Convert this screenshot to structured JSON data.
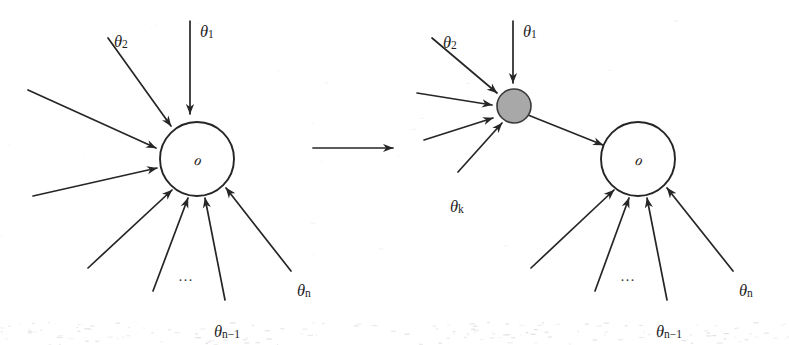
{
  "figure": {
    "background_color": "#ffffff",
    "ink_color": "#262626",
    "filled_node_color": "#a8a8a8",
    "width": 789,
    "height": 345
  },
  "transition": {
    "arrow_name": "transformation-arrow",
    "direction": "right",
    "x1": 313,
    "x2": 393,
    "y": 148
  },
  "panels": [
    {
      "id": "before",
      "name": "left-panel",
      "node": {
        "label": "ℴ",
        "kind": "open-circle",
        "cx": 197,
        "cy": 159,
        "r": 37
      },
      "inputs": [
        {
          "label_base": "θ",
          "label_sub": "1",
          "name": "theta-1-arrow",
          "x1": 190,
          "y1": 21,
          "x2": 190,
          "y2": 114,
          "label_x": 200,
          "label_y": 25
        },
        {
          "label_base": "θ",
          "label_sub": "2",
          "name": "theta-2-arrow",
          "x1": 108,
          "y1": 38,
          "x2": 171,
          "y2": 126,
          "label_x": 114,
          "label_y": 35
        },
        {
          "label_base": "",
          "label_sub": "",
          "name": "input-arrow-3",
          "x1": 28,
          "y1": 90,
          "x2": 156,
          "y2": 148,
          "label_x": 0,
          "label_y": 0
        },
        {
          "label_base": "",
          "label_sub": "",
          "name": "input-arrow-4",
          "x1": 33,
          "y1": 196,
          "x2": 157,
          "y2": 168,
          "label_x": 0,
          "label_y": 0
        },
        {
          "label_base": "",
          "label_sub": "",
          "name": "input-arrow-5",
          "x1": 88,
          "y1": 268,
          "x2": 172,
          "y2": 190,
          "label_x": 0,
          "label_y": 0
        },
        {
          "label_base": "",
          "label_sub": "",
          "name": "input-arrow-6",
          "x1": 153,
          "y1": 291,
          "x2": 188,
          "y2": 198,
          "label_x": 0,
          "label_y": 0
        },
        {
          "label_base": "θ",
          "label_sub": "n−1",
          "name": "theta-n-1-arrow",
          "x1": 225,
          "y1": 300,
          "x2": 205,
          "y2": 198,
          "label_x": 214,
          "label_y": 325
        },
        {
          "label_base": "θ",
          "label_sub": "n",
          "name": "theta-n-arrow",
          "x1": 291,
          "y1": 271,
          "x2": 226,
          "y2": 188,
          "label_x": 297,
          "label_y": 284
        }
      ],
      "ellipsis": {
        "text": "…",
        "x": 186,
        "y": 281
      }
    },
    {
      "id": "after",
      "name": "right-panel",
      "filled_node": {
        "name": "aggregate-node",
        "kind": "filled-circle",
        "cx": 514,
        "cy": 106,
        "r": 17
      },
      "node": {
        "label": "ℴ",
        "kind": "open-circle",
        "cx": 638,
        "cy": 159,
        "r": 37
      },
      "relay_arrow": {
        "name": "aggregate-to-node-arrow",
        "x1": 528,
        "y1": 115,
        "x2": 603,
        "y2": 145
      },
      "inputs_to_filled": [
        {
          "label_base": "θ",
          "label_sub": "1",
          "name": "theta-1-arrow",
          "x1": 513,
          "y1": 21,
          "x2": 513,
          "y2": 83,
          "label_x": 523,
          "label_y": 25
        },
        {
          "label_base": "θ",
          "label_sub": "2",
          "name": "theta-2-arrow",
          "x1": 432,
          "y1": 38,
          "x2": 497,
          "y2": 93,
          "label_x": 443,
          "label_y": 36
        },
        {
          "label_base": "",
          "label_sub": "",
          "name": "input-arrow-3",
          "x1": 417,
          "y1": 93,
          "x2": 492,
          "y2": 105,
          "label_x": 0,
          "label_y": 0
        },
        {
          "label_base": "",
          "label_sub": "",
          "name": "input-arrow-4",
          "x1": 424,
          "y1": 140,
          "x2": 493,
          "y2": 118,
          "label_x": 0,
          "label_y": 0
        },
        {
          "label_base": "θ",
          "label_sub": "k",
          "name": "theta-k-arrow",
          "x1": 458,
          "y1": 172,
          "x2": 502,
          "y2": 123,
          "label_x": 450,
          "label_y": 200
        }
      ],
      "inputs_to_node": [
        {
          "label_base": "",
          "label_sub": "",
          "name": "input-arrow-5",
          "x1": 531,
          "y1": 268,
          "x2": 614,
          "y2": 190,
          "label_x": 0,
          "label_y": 0
        },
        {
          "label_base": "",
          "label_sub": "",
          "name": "input-arrow-6",
          "x1": 595,
          "y1": 291,
          "x2": 629,
          "y2": 198,
          "label_x": 0,
          "label_y": 0
        },
        {
          "label_base": "θ",
          "label_sub": "n−1",
          "name": "theta-n-1-arrow",
          "x1": 667,
          "y1": 300,
          "x2": 647,
          "y2": 198,
          "label_x": 656,
          "label_y": 325
        },
        {
          "label_base": "θ",
          "label_sub": "n",
          "name": "theta-n-arrow",
          "x1": 733,
          "y1": 271,
          "x2": 667,
          "y2": 188,
          "label_x": 739,
          "label_y": 284
        }
      ],
      "ellipsis": {
        "text": "…",
        "x": 628,
        "y": 281
      }
    }
  ]
}
